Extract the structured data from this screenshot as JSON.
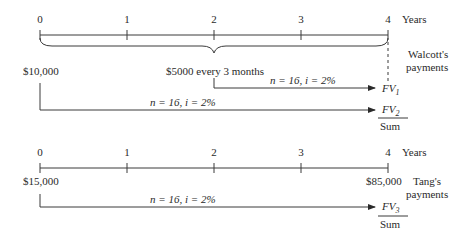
{
  "diagram": {
    "type": "cash-flow-timeline",
    "timelines": [
      {
        "id": "walcott",
        "tick_labels": [
          "0",
          "1",
          "2",
          "3",
          "4"
        ],
        "unit_label": "Years",
        "party_label_line1": "Walcott's",
        "party_label_line2": "payments",
        "initial_payment": "$10,000",
        "annuity_label": "$5000 every 3 months",
        "flows": [
          {
            "from_tick": "2",
            "rate_label_n": "n = 16, ",
            "rate_label_i": "i = 2%",
            "result": "FV",
            "result_sub": "1"
          },
          {
            "from_tick": "0",
            "rate_label_n": "n = 16, ",
            "rate_label_i": "i = 2%",
            "result": "FV",
            "result_sub": "2"
          }
        ],
        "total_label": "Sum"
      },
      {
        "id": "tang",
        "tick_labels": [
          "0",
          "1",
          "2",
          "3",
          "4"
        ],
        "unit_label": "Years",
        "party_label_line1": "Tang's",
        "party_label_line2": "payments",
        "initial_payment": "$15,000",
        "final_payment": "$85,000",
        "flows": [
          {
            "from_tick": "0",
            "rate_label_n": "n = 16, ",
            "rate_label_i": "i = 2%",
            "result": "FV",
            "result_sub": "3"
          }
        ],
        "total_label": "Sum"
      }
    ]
  }
}
